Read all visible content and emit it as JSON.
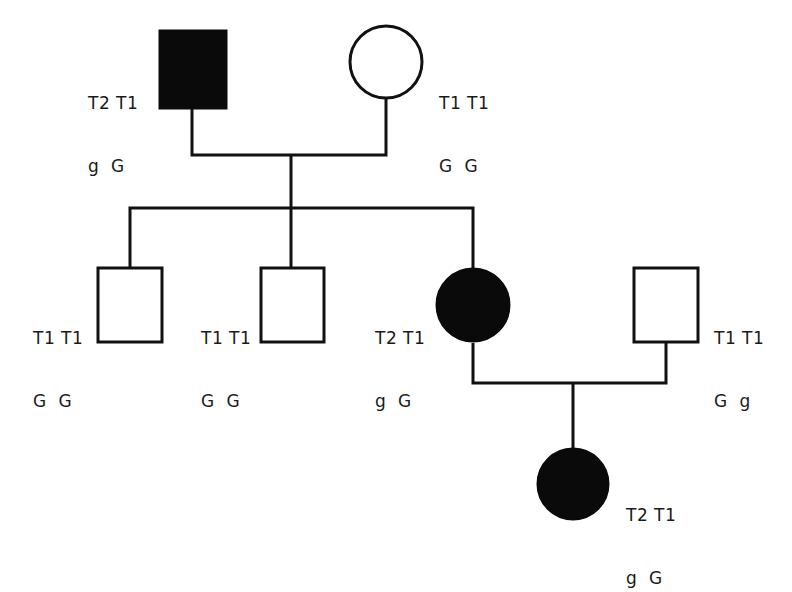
{
  "colors": {
    "line": "#111111",
    "affected_fill": "#0a0a0a",
    "unaffected_fill": "#ffffff"
  },
  "individuals": [
    {
      "id": "I-1",
      "sex": "male",
      "affected": true,
      "label_top": "T2 T1",
      "label_bottom": "g  G"
    },
    {
      "id": "I-2",
      "sex": "female",
      "affected": false,
      "label_top": "T1 T1",
      "label_bottom": "G  G"
    },
    {
      "id": "II-1",
      "sex": "male",
      "affected": false,
      "label_top": "T1 T1",
      "label_bottom": "G  G"
    },
    {
      "id": "II-2",
      "sex": "male",
      "affected": false,
      "label_top": "T1 T1",
      "label_bottom": "G  G"
    },
    {
      "id": "II-3",
      "sex": "female",
      "affected": true,
      "label_top": "T2 T1",
      "label_bottom": "g  G"
    },
    {
      "id": "II-4",
      "sex": "male",
      "affected": false,
      "label_top": "T1 T1",
      "label_bottom": "G  g"
    },
    {
      "id": "III-1",
      "sex": "female",
      "affected": true,
      "label_top": "T2 T1",
      "label_bottom": "g  G"
    }
  ]
}
